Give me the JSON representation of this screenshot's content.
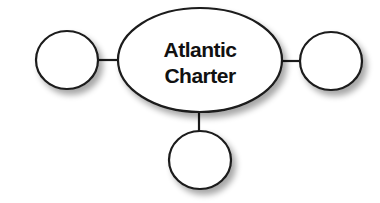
{
  "diagram": {
    "type": "concept-web",
    "colors": {
      "stroke": "#1a1a1a",
      "fill": "#ffffff",
      "text": "#111111",
      "shadow": "#b0b0b0"
    },
    "center": {
      "label_lines": [
        "Atlantic",
        "Charter"
      ]
    },
    "satellites": [
      {
        "position": "left",
        "label": ""
      },
      {
        "position": "right",
        "label": ""
      },
      {
        "position": "bottom",
        "label": ""
      }
    ]
  }
}
